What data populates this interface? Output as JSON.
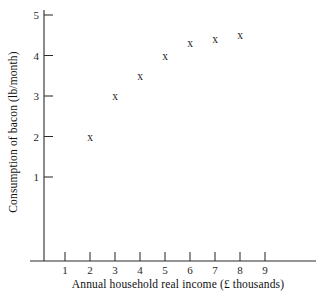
{
  "chart_data": {
    "type": "scatter",
    "title": "",
    "xlabel": "Annual household real income (£ thousands)",
    "ylabel": "Consumption of bacon (lb/month)",
    "xlim": [
      0,
      10
    ],
    "ylim": [
      0,
      5.4
    ],
    "grid": false,
    "legend": null,
    "marker": "x",
    "marker_color": "#2a2a2a",
    "x_ticks": [
      1,
      2,
      3,
      4,
      5,
      6,
      7,
      8,
      9
    ],
    "y_ticks": [
      1,
      2,
      3,
      4,
      5
    ],
    "x_tick_labels": [
      "1",
      "2",
      "3",
      "4",
      "5",
      "6",
      "7",
      "8",
      "9"
    ],
    "y_tick_labels": [
      "1",
      "2",
      "3",
      "4",
      "5"
    ],
    "x": [
      2,
      3,
      4,
      5,
      6,
      7,
      8
    ],
    "y": [
      2.0,
      3.0,
      3.5,
      4.0,
      4.3,
      4.4,
      4.5
    ],
    "points": [
      {
        "x": 2,
        "y": 2.0
      },
      {
        "x": 3,
        "y": 3.0
      },
      {
        "x": 4,
        "y": 3.5
      },
      {
        "x": 5,
        "y": 4.0
      },
      {
        "x": 6,
        "y": 4.3
      },
      {
        "x": 7,
        "y": 4.4
      },
      {
        "x": 8,
        "y": 4.5
      }
    ]
  },
  "figure": {
    "background": "#ffffff",
    "axis_color": "#2b2b2b",
    "text_color": "#101010"
  }
}
